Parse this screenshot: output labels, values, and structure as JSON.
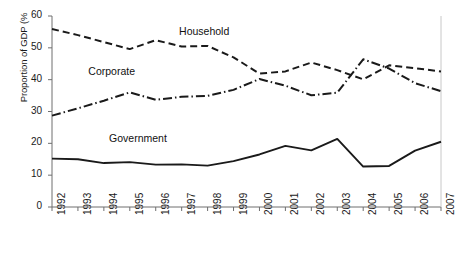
{
  "chart_data": {
    "type": "line",
    "title": "",
    "xlabel": "",
    "ylabel": "Proportion of GDP (%)",
    "ylabel_rendered": "Proportion of GDP (%",
    "xlim": [
      1992,
      2007
    ],
    "ylim": [
      0,
      60
    ],
    "ytick_values": [
      0,
      10,
      20,
      30,
      40,
      50,
      60
    ],
    "ytick_labels": [
      "0",
      "10",
      "20",
      "30",
      "40",
      "50",
      "60"
    ],
    "grid": false,
    "legend_position": "inline-annotations",
    "categories": [
      "1992",
      "1993",
      "1994",
      "1995",
      "1996",
      "1997",
      "1998",
      "1999",
      "2000",
      "2001",
      "2002",
      "2003",
      "2004",
      "2005",
      "2006",
      "2007"
    ],
    "series": [
      {
        "name": "Household",
        "label": "Household",
        "linestyle": "dashed",
        "color": "#1a1a1a",
        "values": [
          55.9,
          54.0,
          51.8,
          49.6,
          52.4,
          50.4,
          50.6,
          47.0,
          41.9,
          42.6,
          45.4,
          43.0,
          40.1,
          44.5,
          43.6,
          42.6
        ]
      },
      {
        "name": "Corporate",
        "label": "Corporate",
        "linestyle": "dash-dot",
        "color": "#1a1a1a",
        "values": [
          28.7,
          31.0,
          33.4,
          36.0,
          33.7,
          34.6,
          34.9,
          36.8,
          40.2,
          38.1,
          35.1,
          35.9,
          46.4,
          43.5,
          38.9,
          36.4
        ]
      },
      {
        "name": "Government",
        "label": "Government",
        "linestyle": "solid",
        "color": "#1a1a1a",
        "values": [
          15.2,
          15.0,
          13.8,
          14.1,
          13.3,
          13.4,
          13.0,
          14.4,
          16.5,
          19.2,
          17.8,
          21.4,
          12.7,
          12.9,
          17.7,
          20.5
        ]
      }
    ],
    "annotations": [
      {
        "text": "Household",
        "x": 1996.9,
        "y": 55.0
      },
      {
        "text": "Corporate",
        "x": 1993.4,
        "y": 42.5
      },
      {
        "text": "Government",
        "x": 1994.2,
        "y": 21.5
      }
    ]
  }
}
